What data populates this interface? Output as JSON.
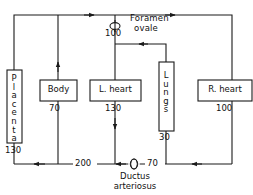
{
  "diagram": {
    "line_color": "#1a1a1a",
    "background": "#ffffff",
    "nodes": [
      {
        "id": "placenta",
        "label": "Placenta",
        "orientation": "vertical",
        "value": "130"
      },
      {
        "id": "body",
        "label": "Body",
        "orientation": "horizontal",
        "value": "70"
      },
      {
        "id": "l-heart",
        "label": "L. heart",
        "orientation": "horizontal",
        "value": "130"
      },
      {
        "id": "lungs",
        "label": "Lungs",
        "orientation": "vertical",
        "value": "30"
      },
      {
        "id": "r-heart",
        "label": "R. heart",
        "orientation": "horizontal",
        "value": "100"
      }
    ],
    "shunts": [
      {
        "id": "foramen-ovale",
        "label_line1": "Foramen",
        "label_line2": "ovale",
        "value": "100",
        "symbol": "valve-ellipse-icon"
      },
      {
        "id": "ductus-arteriosus",
        "label_line1": "Ductus",
        "label_line2": "arteriosus",
        "value": "",
        "symbol": "valve-ellipse-icon"
      }
    ],
    "flow_values": {
      "bottom_left": "200",
      "bottom_right": "70"
    },
    "node_letters": {
      "placenta": [
        "P",
        "l",
        "a",
        "c",
        "e",
        "n",
        "t",
        "a"
      ],
      "lungs": [
        "L",
        "u",
        "n",
        "g",
        "s"
      ]
    }
  }
}
